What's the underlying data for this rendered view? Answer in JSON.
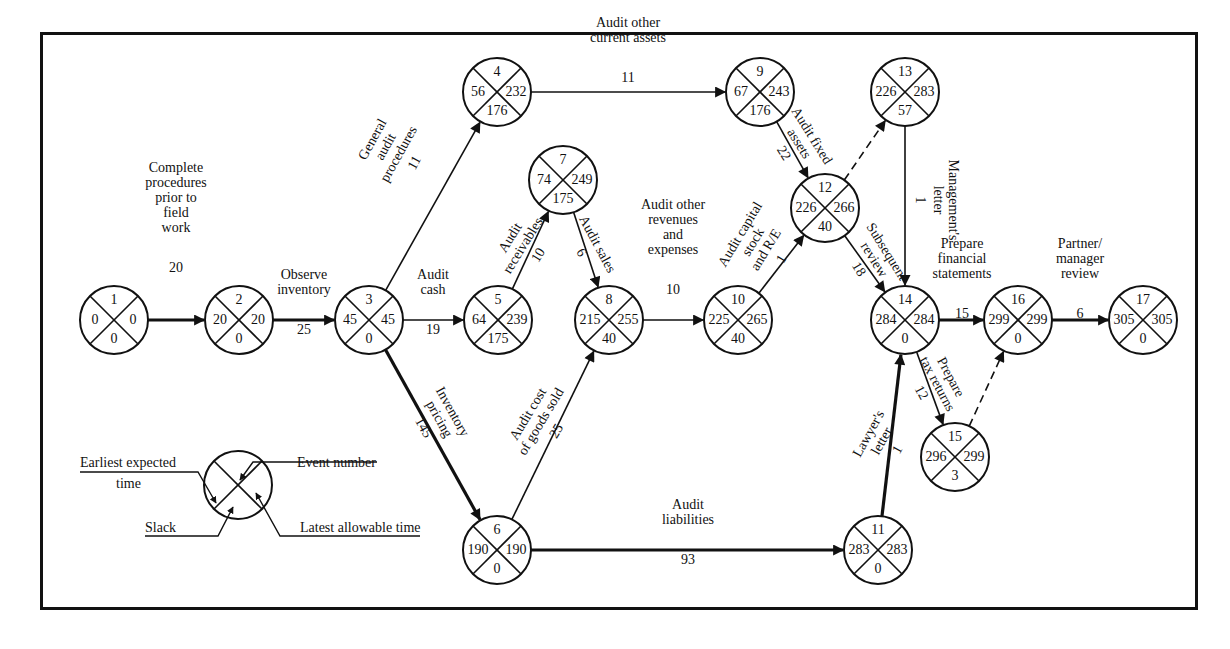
{
  "diagram": {
    "legend": {
      "earliest_expected_time": "Earliest expected",
      "earliest_expected_time_2": "time",
      "event_number": "Event number",
      "slack": "Slack",
      "latest_allowable_time": "Latest allowable time"
    },
    "nodes": [
      {
        "id": "1",
        "event": "1",
        "earliest": "0",
        "latest": "0",
        "slack": "0",
        "x": 114,
        "y": 320
      },
      {
        "id": "2",
        "event": "2",
        "earliest": "20",
        "latest": "20",
        "slack": "0",
        "x": 239,
        "y": 320
      },
      {
        "id": "3",
        "event": "3",
        "earliest": "45",
        "latest": "45",
        "slack": "0",
        "x": 369,
        "y": 320
      },
      {
        "id": "4",
        "event": "4",
        "earliest": "56",
        "latest": "232",
        "slack": "176",
        "x": 497,
        "y": 92
      },
      {
        "id": "5",
        "event": "5",
        "earliest": "64",
        "latest": "239",
        "slack": "175",
        "x": 498,
        "y": 320
      },
      {
        "id": "6",
        "event": "6",
        "earliest": "190",
        "latest": "190",
        "slack": "0",
        "x": 497,
        "y": 550
      },
      {
        "id": "7",
        "event": "7",
        "earliest": "74",
        "latest": "249",
        "slack": "175",
        "x": 563,
        "y": 180
      },
      {
        "id": "8",
        "event": "8",
        "earliest": "215",
        "latest": "255",
        "slack": "40",
        "x": 609,
        "y": 320
      },
      {
        "id": "9",
        "event": "9",
        "earliest": "67",
        "latest": "243",
        "slack": "176",
        "x": 760,
        "y": 92
      },
      {
        "id": "10",
        "event": "10",
        "earliest": "225",
        "latest": "265",
        "slack": "40",
        "x": 738,
        "y": 320
      },
      {
        "id": "11",
        "event": "11",
        "earliest": "283",
        "latest": "283",
        "slack": "0",
        "x": 878,
        "y": 550
      },
      {
        "id": "12",
        "event": "12",
        "earliest": "226",
        "latest": "266",
        "slack": "40",
        "x": 825,
        "y": 208
      },
      {
        "id": "13",
        "event": "13",
        "earliest": "226",
        "latest": "283",
        "slack": "57",
        "x": 905,
        "y": 92
      },
      {
        "id": "14",
        "event": "14",
        "earliest": "284",
        "latest": "284",
        "slack": "0",
        "x": 905,
        "y": 320
      },
      {
        "id": "15",
        "event": "15",
        "earliest": "296",
        "latest": "299",
        "slack": "3",
        "x": 955,
        "y": 457
      },
      {
        "id": "16",
        "event": "16",
        "earliest": "299",
        "latest": "299",
        "slack": "0",
        "x": 1018,
        "y": 320
      },
      {
        "id": "17",
        "event": "17",
        "earliest": "305",
        "latest": "305",
        "slack": "0",
        "x": 1143,
        "y": 320
      }
    ],
    "edges": [
      {
        "from": "1",
        "to": "2",
        "label": [
          "Complete",
          "procedures",
          "prior to",
          "field",
          "work"
        ],
        "duration": "20",
        "type": "critical"
      },
      {
        "from": "2",
        "to": "3",
        "label": [
          "Observe",
          "inventory"
        ],
        "duration": "25",
        "type": "critical"
      },
      {
        "from": "3",
        "to": "4",
        "label": [
          "General",
          "audit",
          "procedures"
        ],
        "duration": "11",
        "type": "normal"
      },
      {
        "from": "3",
        "to": "5",
        "label": [
          "Audit",
          "cash"
        ],
        "duration": "19",
        "type": "normal"
      },
      {
        "from": "3",
        "to": "6",
        "label": [
          "Inventory",
          "pricing"
        ],
        "duration": "145",
        "type": "critical"
      },
      {
        "from": "4",
        "to": "9",
        "label": [
          "Audit other",
          "current assets"
        ],
        "duration": "11",
        "type": "normal"
      },
      {
        "from": "5",
        "to": "7",
        "label": [
          "Audit",
          "receivables"
        ],
        "duration": "10",
        "type": "normal"
      },
      {
        "from": "7",
        "to": "8",
        "label": [
          "Audit sales"
        ],
        "duration": "6",
        "type": "normal"
      },
      {
        "from": "6",
        "to": "8",
        "label": [
          "Audit cost",
          "of goods sold"
        ],
        "duration": "25",
        "type": "normal"
      },
      {
        "from": "8",
        "to": "10",
        "label": [
          "Audit other",
          "revenues",
          "and",
          "expenses"
        ],
        "duration": "10",
        "type": "normal"
      },
      {
        "from": "9",
        "to": "12",
        "label": [
          "Audit fixed",
          "assets"
        ],
        "duration": "22",
        "type": "normal"
      },
      {
        "from": "10",
        "to": "12",
        "label": [
          "Audit capital",
          "stock",
          "and R/E"
        ],
        "duration": "1",
        "type": "normal"
      },
      {
        "from": "12",
        "to": "13",
        "label": [],
        "duration": "",
        "type": "dummy"
      },
      {
        "from": "12",
        "to": "14",
        "label": [
          "Subsequent",
          "review"
        ],
        "duration": "18",
        "type": "normal"
      },
      {
        "from": "13",
        "to": "14",
        "label": [
          "Management's",
          "letter"
        ],
        "duration": "1",
        "type": "normal"
      },
      {
        "from": "6",
        "to": "11",
        "label": [
          "Audit",
          "liabilities"
        ],
        "duration": "93",
        "type": "critical"
      },
      {
        "from": "11",
        "to": "14",
        "label": [
          "Lawyer's",
          "letter"
        ],
        "duration": "1",
        "type": "critical"
      },
      {
        "from": "14",
        "to": "16",
        "label": [
          "Prepare",
          "financial",
          "statements"
        ],
        "duration": "15",
        "type": "critical"
      },
      {
        "from": "14",
        "to": "15",
        "label": [
          "Prepare",
          "tax returns"
        ],
        "duration": "12",
        "type": "normal"
      },
      {
        "from": "15",
        "to": "16",
        "label": [],
        "duration": "",
        "type": "dummy"
      },
      {
        "from": "16",
        "to": "17",
        "label": [
          "Partner/",
          "manager",
          "review"
        ],
        "duration": "6",
        "type": "critical"
      }
    ]
  }
}
